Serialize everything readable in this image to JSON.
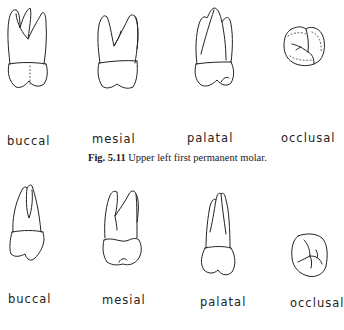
{
  "figures": [
    {
      "number": "Fig. 5.11",
      "caption": "Upper left first permanent molar.",
      "views": [
        {
          "label": "buccal"
        },
        {
          "label": "mesial"
        },
        {
          "label": "palatal"
        },
        {
          "label": "occlusal"
        }
      ]
    },
    {
      "number": "",
      "caption": "",
      "views": [
        {
          "label": "buccal"
        },
        {
          "label": "mesial"
        },
        {
          "label": "palatal"
        },
        {
          "label": "occlusal"
        }
      ]
    }
  ]
}
